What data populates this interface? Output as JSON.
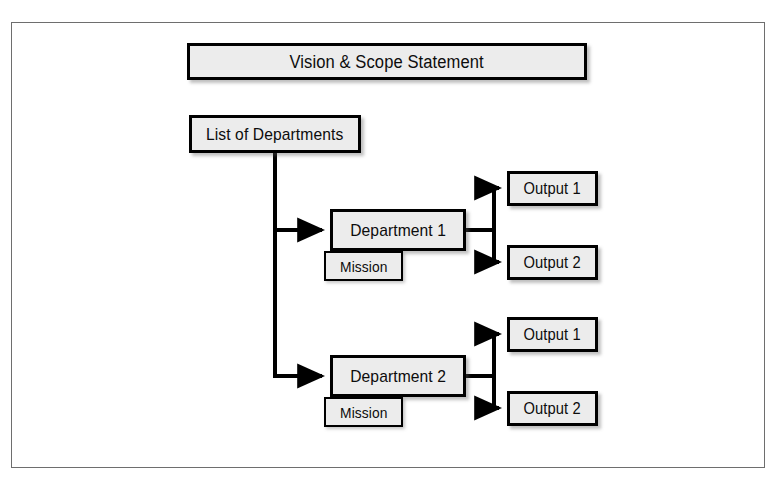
{
  "page": {
    "top_text_remnant": "",
    "bottom_text_remnant": ""
  },
  "figure": {
    "frame_border_color": "#6e6e6e",
    "background_color": "#ffffff"
  },
  "diagram": {
    "type": "hierarchy-flowchart",
    "box_fill_color": "#ececec",
    "box_border_color": "#000000",
    "connector_color": "#000000",
    "nodes": {
      "vision": {
        "label": "Vision & Scope Statement"
      },
      "departments": {
        "label": "List of Departments"
      },
      "department_1": {
        "label": "Department 1"
      },
      "department_2": {
        "label": "Department 2"
      },
      "mission_1": {
        "label": "Mission"
      },
      "mission_2": {
        "label": "Mission"
      },
      "output_1a": {
        "label": "Output 1"
      },
      "output_1b": {
        "label": "Output 2"
      },
      "output_2a": {
        "label": "Output 1"
      },
      "output_2b": {
        "label": "Output 2"
      }
    },
    "connections": [
      {
        "from": "departments",
        "to": "department_1",
        "arrow": true
      },
      {
        "from": "departments",
        "to": "department_2",
        "arrow": true
      },
      {
        "from": "department_1",
        "to": "output_1a",
        "arrow": true
      },
      {
        "from": "department_1",
        "to": "output_1b",
        "arrow": true
      },
      {
        "from": "department_2",
        "to": "output_2a",
        "arrow": true
      },
      {
        "from": "department_2",
        "to": "output_2b",
        "arrow": true
      }
    ]
  }
}
